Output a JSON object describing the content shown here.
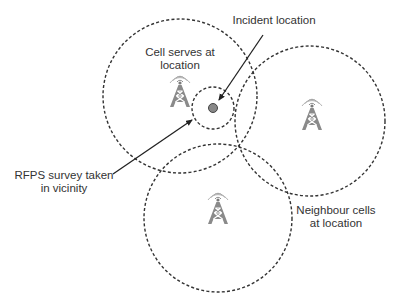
{
  "diagram": {
    "colors": {
      "line": "#333333",
      "tower": "#8a8a8a",
      "incident_dot": "#888888",
      "text": "#333333",
      "background": "#ffffff"
    },
    "labels": {
      "serving_cell_line1": "Cell serves at",
      "serving_cell_line2": "location",
      "incident": "Incident location",
      "rfps_line1": "RFPS survey taken",
      "rfps_line2": "in vicinity",
      "neighbour_line1": "Neighbour cells",
      "neighbour_line2": "at location"
    },
    "cells": [
      {
        "name": "serving-cell",
        "cx": 180,
        "cy": 96,
        "r": 77
      },
      {
        "name": "neighbour-cell-east",
        "cx": 310,
        "cy": 121,
        "r": 75
      },
      {
        "name": "neighbour-cell-south",
        "cx": 218,
        "cy": 218,
        "r": 74
      }
    ],
    "survey_area": {
      "cx": 213,
      "cy": 108,
      "r": 21
    },
    "incident_point": {
      "cx": 213,
      "cy": 108,
      "r": 4
    },
    "icons": [
      "cell-tower-icon",
      "cell-tower-icon",
      "cell-tower-icon"
    ]
  }
}
